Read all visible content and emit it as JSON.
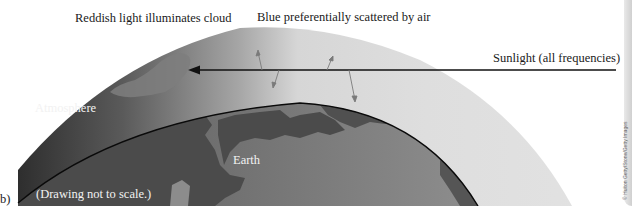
{
  "figure": {
    "panel_label": "b)",
    "labels": {
      "reddish_light": "Reddish light illuminates cloud",
      "blue_scattered": "Blue preferentially scattered by air",
      "sunlight": "Sunlight (all frequencies)",
      "atmosphere": "Atmosphere",
      "earth": "Earth",
      "scale_note": "(Drawing not to scale.)"
    },
    "side_credit": "© Hulton Getty/Stone/Getty Images",
    "colors": {
      "atmosphere_dark": "#3a3a3a",
      "atmosphere_light": "#dcdcdc",
      "earth_ocean": "#8a8a8a",
      "earth_land": "#555555",
      "cloud": "#7a7a7a",
      "arrow": "#111111",
      "scatter_arrow": "#777777"
    },
    "elements": {
      "sunlight_ray": "sunlight-arrow",
      "scatter_arrows": 4
    }
  }
}
